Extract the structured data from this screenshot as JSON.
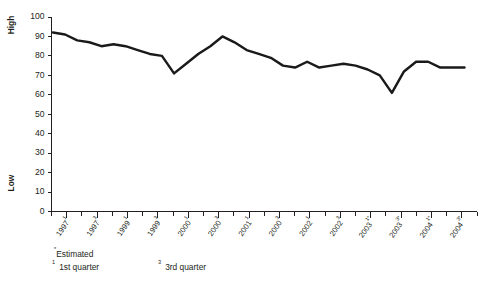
{
  "chart_data": {
    "type": "line",
    "title": "",
    "subtitle": "",
    "xlabel": "",
    "ylabel": "",
    "ylim": [
      0,
      100
    ],
    "grid": false,
    "legend": "none",
    "y_axis": {
      "label_high": "High",
      "label_low": "Low",
      "ticks": [
        0,
        10,
        20,
        30,
        40,
        50,
        60,
        70,
        80,
        90,
        100
      ],
      "tick_labels": [
        "0",
        "10",
        "20",
        "30",
        "40",
        "50",
        "60",
        "70",
        "80",
        "90",
        "100"
      ]
    },
    "x_axis": {
      "tick_labels": [
        {
          "year": "1997",
          "sup": "1",
          "est": false
        },
        {
          "year": "1997",
          "sup": "3",
          "est": false
        },
        {
          "year": "1999",
          "sup": "1",
          "est": false
        },
        {
          "year": "1999",
          "sup": "3",
          "est": false
        },
        {
          "year": "2000",
          "sup": "1",
          "est": false
        },
        {
          "year": "2000",
          "sup": "3",
          "est": false
        },
        {
          "year": "2001",
          "sup": "1",
          "est": false
        },
        {
          "year": "2000",
          "sup": "3",
          "est": false
        },
        {
          "year": "2002",
          "sup": "1",
          "est": false
        },
        {
          "year": "2002",
          "sup": "3",
          "est": false
        },
        {
          "year": "2003",
          "sup": "1",
          "est": true
        },
        {
          "year": "2003",
          "sup": "3",
          "est": true
        },
        {
          "year": "2004",
          "sup": "1",
          "est": true
        },
        {
          "year": "2004",
          "sup": "3",
          "est": true
        }
      ],
      "minor_ticks_between": 1
    },
    "categories": [
      "1997 Q1",
      "1997 Q2",
      "1997 Q3",
      "1997 Q4",
      "1998 Q1",
      "1998 Q2",
      "1998 Q3",
      "1998 Q4",
      "1999 Q1",
      "1999 Q2",
      "1999 Q3",
      "1999 Q4",
      "2000 Q1",
      "2000 Q2",
      "2000 Q3",
      "2000 Q4",
      "2001 Q1",
      "2001 Q2",
      "2001 Q3",
      "2001 Q4",
      "2002 Q1",
      "2002 Q2",
      "2002 Q3",
      "2002 Q4",
      "2003 Q1",
      "2003 Q2",
      "2003 Q3",
      "2003 Q4",
      "2004 Q1",
      "2004 Q2",
      "2004 Q3",
      "2004 Q4"
    ],
    "values": [
      92,
      91,
      88,
      87,
      85,
      86,
      85,
      83,
      81,
      80,
      71,
      76,
      81,
      85,
      90,
      87,
      83,
      81,
      79,
      75,
      74,
      77,
      74,
      75,
      76,
      75,
      73,
      70,
      61,
      72,
      77,
      77
    ],
    "values_tail": [
      74,
      74,
      74
    ],
    "marker": "none",
    "line_color": "#1a1a1a"
  },
  "footnotes": {
    "estimated": "Estimated",
    "estimated_marker": "*",
    "quarter_first_sup": "1",
    "quarter_first": "1st quarter",
    "quarter_third_sup": "3",
    "quarter_third": "3rd quarter"
  }
}
